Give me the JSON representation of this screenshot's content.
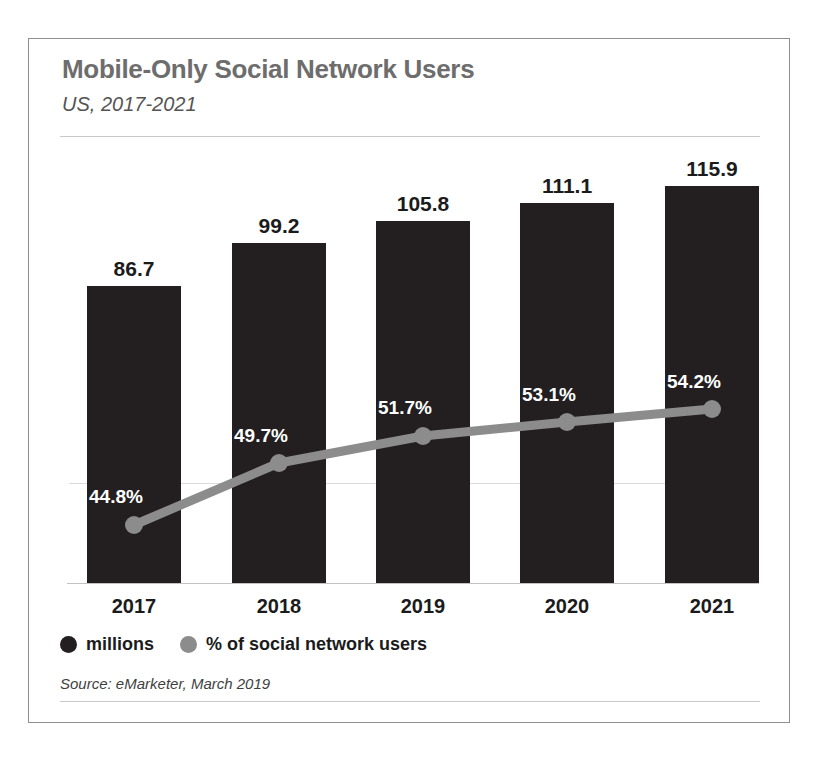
{
  "header": {
    "title": "Mobile-Only Social Network Users",
    "subtitle": "US, 2017-2021"
  },
  "footer": {
    "source": "Source: eMarketer, March 2019"
  },
  "legend": {
    "items": [
      {
        "label": "millions",
        "color": "#231f20",
        "marker": "circle-icon"
      },
      {
        "label": "% of social network users",
        "color": "#8c8c8c",
        "marker": "circle-icon"
      }
    ]
  },
  "colors": {
    "bar": "#231f20",
    "line": "#8c8c8c",
    "title": "#6d6d6d",
    "gridline": "#dcdcdc",
    "border": "#8e8e8e",
    "value_label": "#1b1b1b",
    "pct_label": "#ffffff"
  },
  "chart_data": {
    "type": "bar",
    "title": "Mobile-Only Social Network Users",
    "subtitle": "US, 2017-2021",
    "xlabel": "",
    "ylabel": "",
    "grid": true,
    "legend_position": "bottom-left",
    "categories": [
      "2017",
      "2018",
      "2019",
      "2020",
      "2021"
    ],
    "series": [
      {
        "name": "millions",
        "type": "bar",
        "color": "#231f20",
        "values": [
          86.7,
          99.2,
          105.8,
          111.1,
          115.9
        ],
        "labels": [
          "86.7",
          "99.2",
          "105.8",
          "111.1",
          "115.9"
        ],
        "ylim": [
          0,
          130
        ]
      },
      {
        "name": "% of social network users",
        "type": "line",
        "color": "#8c8c8c",
        "values": [
          44.8,
          49.7,
          51.7,
          53.1,
          54.2
        ],
        "labels": [
          "44.8%",
          "49.7%",
          "51.7%",
          "53.1%",
          "54.2%"
        ],
        "ylim": [
          0,
          100
        ]
      }
    ],
    "source": "Source: eMarketer, March 2019"
  },
  "geometry": {
    "bar_x": [
      58,
      203,
      347,
      491,
      636
    ],
    "bar_width": 94,
    "bar_top": [
      247,
      204,
      182,
      164,
      147
    ],
    "baseline_y": 545,
    "label_top": [
      218,
      175,
      153,
      135,
      118
    ],
    "marker_x": [
      105,
      250,
      394,
      538,
      683
    ],
    "marker_y": [
      486,
      424,
      397,
      383,
      370
    ],
    "pct_label_x": [
      60,
      205,
      349,
      493,
      638
    ],
    "pct_label_y": [
      447,
      386,
      358,
      345,
      332
    ]
  }
}
